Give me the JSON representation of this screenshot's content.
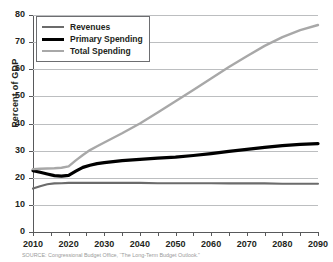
{
  "chart_data": {
    "type": "line",
    "title": "",
    "xlabel": "",
    "ylabel": "Percent of GDP",
    "xlim": [
      2010,
      2090
    ],
    "ylim": [
      0,
      80
    ],
    "grid": true,
    "legend_position": "top-left-inside",
    "y_ticks": [
      0,
      10,
      20,
      30,
      40,
      50,
      60,
      70,
      80
    ],
    "x_ticks": [
      2010,
      2015,
      2020,
      2025,
      2030,
      2035,
      2040,
      2045,
      2050,
      2055,
      2060,
      2065,
      2070,
      2075,
      2080,
      2085,
      2090
    ],
    "x_tick_labels": [
      "2010",
      "2020",
      "2030",
      "2040",
      "2050",
      "2060",
      "2070",
      "2080",
      "2090"
    ],
    "x_labeled_values": [
      2010,
      2020,
      2030,
      2040,
      2050,
      2060,
      2070,
      2080,
      2090
    ],
    "x": [
      2010,
      2012,
      2014,
      2016,
      2018,
      2020,
      2022,
      2024,
      2026,
      2028,
      2030,
      2035,
      2040,
      2045,
      2050,
      2055,
      2060,
      2065,
      2070,
      2075,
      2080,
      2085,
      2090
    ],
    "series": [
      {
        "name": "Revenues",
        "color": "#6b6b6b",
        "width": 2.1,
        "values": [
          16.0,
          16.9,
          17.6,
          17.9,
          18.0,
          18.1,
          18.1,
          18.1,
          18.1,
          18.1,
          18.1,
          18.1,
          18.1,
          18.0,
          18.0,
          18.0,
          18.0,
          17.9,
          17.9,
          17.9,
          17.8,
          17.8,
          17.8
        ]
      },
      {
        "name": "Primary Spending",
        "color": "#000000",
        "width": 3.2,
        "values": [
          22.6,
          22.0,
          21.4,
          20.8,
          20.6,
          20.9,
          22.4,
          23.8,
          24.6,
          25.2,
          25.6,
          26.3,
          26.8,
          27.2,
          27.6,
          28.2,
          28.9,
          29.7,
          30.5,
          31.2,
          31.8,
          32.3,
          32.6
        ]
      },
      {
        "name": "Total Spending",
        "color": "#a8a8a8",
        "width": 2.4,
        "values": [
          23.2,
          23.3,
          23.4,
          23.5,
          23.7,
          24.2,
          26.4,
          28.4,
          30.2,
          31.6,
          33.0,
          36.4,
          40.0,
          44.0,
          48.2,
          52.4,
          56.6,
          60.8,
          64.8,
          68.6,
          71.8,
          74.4,
          76.3
        ]
      }
    ]
  },
  "legend": {
    "items": [
      {
        "label": "Revenues",
        "color": "#6b6b6b",
        "thickness": 2
      },
      {
        "label": "Primary Spending",
        "color": "#000000",
        "thickness": 3
      },
      {
        "label": "Total Spending",
        "color": "#a8a8a8",
        "thickness": 2
      }
    ]
  },
  "axes": {
    "y_title": "Percent of GDP"
  },
  "footer": {
    "source": "SOURCE: Congressional Budget Office, “The Long-Term Budget Outlook.”"
  },
  "colors": {
    "revenues": "#6b6b6b",
    "primary_spending": "#000000",
    "total_spending": "#a8a8a8",
    "gridline": "#bcbec0",
    "axis": "#58595b",
    "text": "#231f20"
  }
}
